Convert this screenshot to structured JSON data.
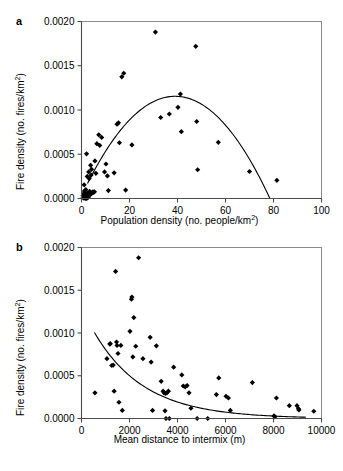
{
  "figure": {
    "panel_a_label": "a",
    "panel_b_label": "b",
    "caption_fragment": ""
  },
  "chart_data": [
    {
      "type": "scatter",
      "panel": "a",
      "title": "",
      "xlabel": "Population density (no. people/km2)",
      "xlabel_base": "Population density (no. people/km",
      "xlabel_sup": "2",
      "xlabel_tail": ")",
      "ylabel": "Fire density (no. fires/km2)",
      "ylabel_base": "Fire density (no. fires/km",
      "ylabel_sup": "2",
      "ylabel_tail": ")",
      "xlim": [
        0,
        100
      ],
      "ylim": [
        0,
        0.002
      ],
      "xticks": [
        0,
        20,
        40,
        60,
        80,
        100
      ],
      "xticklabels": [
        "0",
        "20",
        "40",
        "60",
        "80",
        "100"
      ],
      "yticks": [
        0,
        0.0005,
        0.001,
        0.0015,
        0.002
      ],
      "yticklabels": [
        "0.0000",
        "0.0005",
        "0.0010",
        "0.0015",
        "0.0020"
      ],
      "grid": false,
      "legend": "none",
      "marker": "diamond",
      "marker_color": "#000000",
      "points": [
        [
          0.6,
          3e-05
        ],
        [
          0.7,
          1e-05
        ],
        [
          0.9,
          5.5e-05
        ],
        [
          1.0,
          5e-06
        ],
        [
          1.1,
          0.000155
        ],
        [
          1.2,
          8.5e-05
        ],
        [
          1.3,
          2e-05
        ],
        [
          1.4,
          1e-05
        ],
        [
          1.5,
          6e-05
        ],
        [
          1.6,
          0.0
        ],
        [
          1.8,
          0.0001
        ],
        [
          1.9,
          3.5e-05
        ],
        [
          2.0,
          1.5e-05
        ],
        [
          2.1,
          0.000505
        ],
        [
          2.2,
          0.0
        ],
        [
          2.4,
          0.00025
        ],
        [
          2.6,
          6e-05
        ],
        [
          2.8,
          1.5e-05
        ],
        [
          3.0,
          0.0003
        ],
        [
          3.2,
          0.000225
        ],
        [
          3.4,
          8e-05
        ],
        [
          3.6,
          4e-05
        ],
        [
          3.8,
          0.000375
        ],
        [
          4.0,
          0.000265
        ],
        [
          4.2,
          0.00033
        ],
        [
          4.4,
          6.5e-05
        ],
        [
          4.6,
          7e-05
        ],
        [
          4.8,
          7.5e-05
        ],
        [
          5.0,
          7e-05
        ],
        [
          5.4,
          7.5e-05
        ],
        [
          5.6,
          0.000425
        ],
        [
          6.0,
          0.000285
        ],
        [
          6.4,
          0.00062
        ],
        [
          7.2,
          0.00072
        ],
        [
          7.6,
          0.0006
        ],
        [
          8.4,
          0.00069
        ],
        [
          9.6,
          0.0003
        ],
        [
          10.2,
          0.00039
        ],
        [
          10.8,
          0.000255
        ],
        [
          11.2,
          9e-05
        ],
        [
          13.6,
          0.00029
        ],
        [
          14.8,
          0.00084
        ],
        [
          15.4,
          0.000855
        ],
        [
          15.8,
          0.00063
        ],
        [
          16.8,
          0.001375
        ],
        [
          17.6,
          0.001415
        ],
        [
          18.4,
          9.5e-05
        ],
        [
          21.0,
          0.000605
        ],
        [
          30.8,
          0.00188
        ],
        [
          33.0,
          0.000915
        ],
        [
          36.6,
          0.000955
        ],
        [
          40.2,
          0.00103
        ],
        [
          41.2,
          0.00118
        ],
        [
          41.6,
          0.000755
        ],
        [
          47.6,
          0.00172
        ],
        [
          48.0,
          0.00087
        ],
        [
          48.4,
          0.000325
        ],
        [
          57.0,
          0.000635
        ],
        [
          70.0,
          0.000305
        ],
        [
          81.4,
          0.000205
        ]
      ],
      "fit": {
        "kind": "quadratic",
        "description": "downward parabola peaking near x=39",
        "x_start": 2.5,
        "x_end": 78.5,
        "peak_x": 39.0,
        "peak_y": 0.001155
      }
    },
    {
      "type": "scatter",
      "panel": "b",
      "title": "",
      "xlabel": "Mean distance to intermix (m)",
      "ylabel": "Fire density (no. fires/km2)",
      "ylabel_base": "Fire density (no. fires/km",
      "ylabel_sup": "2",
      "ylabel_tail": ")",
      "xlim": [
        0,
        10000
      ],
      "ylim": [
        0,
        0.002
      ],
      "xticks": [
        0,
        2000,
        4000,
        6000,
        8000,
        10000
      ],
      "xticklabels": [
        "0",
        "2000",
        "4000",
        "6000",
        "8000",
        "10000"
      ],
      "yticks": [
        0,
        0.0005,
        0.001,
        0.0015,
        0.002
      ],
      "yticklabels": [
        "0.0000",
        "0.0005",
        "0.0010",
        "0.0015",
        "0.0020"
      ],
      "grid": false,
      "legend": "none",
      "marker": "diamond",
      "marker_color": "#000000",
      "points": [
        [
          560,
          0.0003
        ],
        [
          1060,
          0.0007
        ],
        [
          1180,
          0.00087
        ],
        [
          1200,
          0.000875
        ],
        [
          1260,
          0.00062
        ],
        [
          1320,
          0.000625
        ],
        [
          1360,
          0.00032
        ],
        [
          1420,
          0.00172
        ],
        [
          1460,
          0.000895
        ],
        [
          1480,
          0.000855
        ],
        [
          1520,
          0.00076
        ],
        [
          1560,
          0.00019
        ],
        [
          1640,
          0.000855
        ],
        [
          1700,
          9.5e-05
        ],
        [
          2020,
          0.00102
        ],
        [
          2080,
          0.001395
        ],
        [
          2100,
          0.00142
        ],
        [
          2140,
          0.00072
        ],
        [
          2180,
          0.00118
        ],
        [
          2260,
          0.000845
        ],
        [
          2380,
          0.00188
        ],
        [
          2560,
          0.0007
        ],
        [
          2860,
          0.00095
        ],
        [
          2900,
          0.00066
        ],
        [
          2960,
          9.5e-05
        ],
        [
          3120,
          0.00085
        ],
        [
          3320,
          0.000435
        ],
        [
          3400,
          0.00032
        ],
        [
          3440,
          0.0003
        ],
        [
          3480,
          9e-05
        ],
        [
          3500,
          0.000295
        ],
        [
          3520,
          0.0
        ],
        [
          3560,
          0.0003
        ],
        [
          3620,
          0.00032
        ],
        [
          3660,
          0.0
        ],
        [
          3840,
          0.0006
        ],
        [
          4180,
          0.00051
        ],
        [
          4240,
          0.00038
        ],
        [
          4320,
          0.00037
        ],
        [
          4400,
          0.000385
        ],
        [
          4480,
          0.0003
        ],
        [
          4560,
          0.00012
        ],
        [
          4820,
          0.0
        ],
        [
          5260,
          0.0
        ],
        [
          5620,
          0.00028
        ],
        [
          5720,
          0.000475
        ],
        [
          6020,
          0.00026
        ],
        [
          6120,
          0.00024
        ],
        [
          6200,
          9.5e-05
        ],
        [
          7120,
          0.00042
        ],
        [
          8020,
          3e-05
        ],
        [
          8060,
          2e-05
        ],
        [
          8120,
          0.00024
        ],
        [
          8660,
          0.00015
        ],
        [
          8980,
          0.00015
        ],
        [
          9040,
          0.000115
        ],
        [
          9060,
          0.0001
        ],
        [
          9680,
          8.5e-05
        ]
      ],
      "fit": {
        "kind": "exponential-decay",
        "description": "monotonic decreasing curve from ~0.00100 at x=560 to ~0.00002 at x=9300",
        "x_start": 540,
        "x_end": 9350,
        "y_start": 0.001005,
        "y_end": 1.5e-05
      }
    }
  ]
}
